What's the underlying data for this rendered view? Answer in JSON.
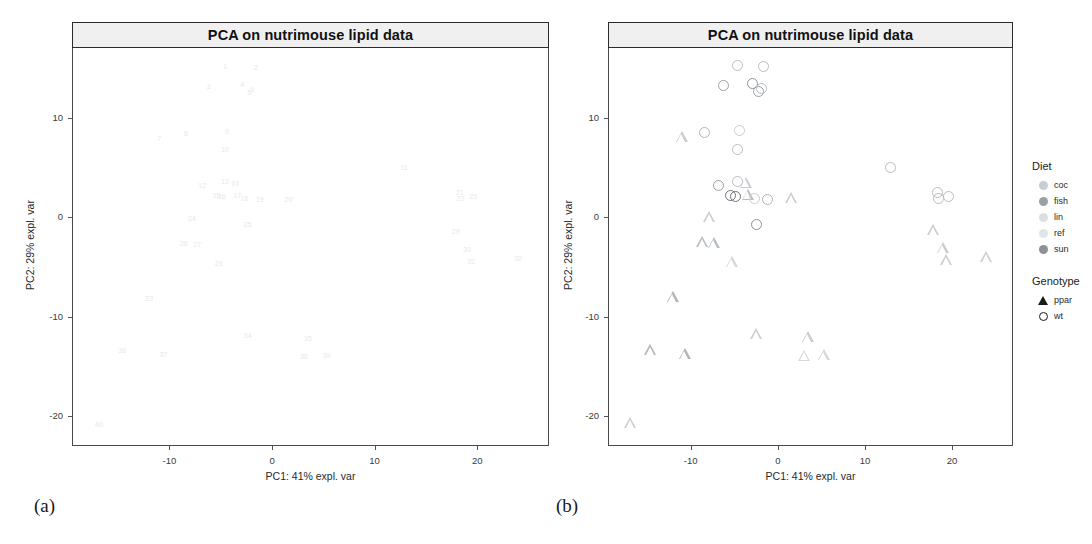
{
  "figure": {
    "panels": [
      {
        "id": "a",
        "sublabel": "(a)",
        "has_legend": false,
        "marker_mode": "text-ids"
      },
      {
        "id": "b",
        "sublabel": "(b)",
        "has_legend": true,
        "marker_mode": "shapes"
      }
    ]
  },
  "chart_data": {
    "type": "scatter",
    "title": "PCA on nutrimouse lipid data",
    "xlabel": "PC1: 41% expl. var",
    "ylabel": "PC2: 29% expl. var",
    "xlim": [
      -19.5,
      27.0
    ],
    "ylim": [
      -23.0,
      17.0
    ],
    "xticks": [
      -10,
      0,
      10,
      20
    ],
    "yticks": [
      10,
      0,
      -10,
      -20
    ],
    "xtick_labels": [
      "-10",
      "0",
      "10",
      "20"
    ],
    "ytick_labels": [
      "10",
      "0",
      "-10",
      "-20"
    ],
    "grid": false,
    "legend_position": "right",
    "legends": [
      {
        "title": "Diet",
        "key_type": "fill-circle",
        "entries": [
          {
            "label": "coc",
            "color": "#c9cdd1"
          },
          {
            "label": "fish",
            "color": "#9aa0a6"
          },
          {
            "label": "lin",
            "color": "#dcdfe2"
          },
          {
            "label": "ref",
            "color": "#e2e5e8"
          },
          {
            "label": "sun",
            "color": "#8b9197"
          }
        ]
      },
      {
        "title": "Genotype",
        "key_type": "shape",
        "entries": [
          {
            "label": "ppar",
            "shape": "triangle"
          },
          {
            "label": "wt",
            "shape": "circle"
          }
        ]
      }
    ],
    "points": [
      {
        "id": "1",
        "x": -4.6,
        "y": 15.2,
        "diet": "ref",
        "genotype": "wt",
        "color": "#b9bec3"
      },
      {
        "id": "2",
        "x": -1.6,
        "y": 15.1,
        "diet": "coc",
        "genotype": "wt",
        "color": "#b9bec3"
      },
      {
        "id": "3",
        "x": -6.2,
        "y": 13.2,
        "diet": "lin",
        "genotype": "wt",
        "color": "#9aa0a6"
      },
      {
        "id": "4",
        "x": -2.9,
        "y": 13.4,
        "diet": "fish",
        "genotype": "wt",
        "color": "#8b9197"
      },
      {
        "id": "5",
        "x": -2.2,
        "y": 12.6,
        "diet": "sun",
        "genotype": "wt",
        "color": "#9aa0a6"
      },
      {
        "id": "6",
        "x": -1.9,
        "y": 12.9,
        "diet": "ref",
        "genotype": "wt",
        "color": "#b9bec3"
      },
      {
        "id": "7",
        "x": -11.0,
        "y": 8.0,
        "diet": "coc",
        "genotype": "ppar",
        "color": "#c9cdd1"
      },
      {
        "id": "8",
        "x": -8.4,
        "y": 8.5,
        "diet": "lin",
        "genotype": "wt",
        "color": "#b0b5ba"
      },
      {
        "id": "9",
        "x": -4.4,
        "y": 8.7,
        "diet": "ref",
        "genotype": "wt",
        "color": "#c9cdd1"
      },
      {
        "id": "10",
        "x": -4.6,
        "y": 6.8,
        "diet": "sun",
        "genotype": "wt",
        "color": "#b9bec3"
      },
      {
        "id": "11",
        "x": 12.9,
        "y": 5.0,
        "diet": "fish",
        "genotype": "wt",
        "color": "#b9bec3"
      },
      {
        "id": "12",
        "x": -6.8,
        "y": 3.2,
        "diet": "coc",
        "genotype": "wt",
        "color": "#9aa0a6"
      },
      {
        "id": "13",
        "x": -4.6,
        "y": 3.6,
        "diet": "lin",
        "genotype": "wt",
        "color": "#b9bec3"
      },
      {
        "id": "14",
        "x": -3.6,
        "y": 3.4,
        "diet": "ref",
        "genotype": "ppar",
        "color": "#c9cdd1"
      },
      {
        "id": "15",
        "x": -5.4,
        "y": 2.2,
        "diet": "sun",
        "genotype": "wt",
        "color": "#6f7479"
      },
      {
        "id": "16",
        "x": -4.9,
        "y": 2.1,
        "diet": "fish",
        "genotype": "wt",
        "color": "#6f7479"
      },
      {
        "id": "17",
        "x": -3.4,
        "y": 2.2,
        "diet": "coc",
        "genotype": "ppar",
        "color": "#b9bec3"
      },
      {
        "id": "18",
        "x": -2.7,
        "y": 1.9,
        "diet": "lin",
        "genotype": "wt",
        "color": "#c9cdd1"
      },
      {
        "id": "19",
        "x": -1.2,
        "y": 1.8,
        "diet": "ref",
        "genotype": "wt",
        "color": "#b0b5ba"
      },
      {
        "id": "20",
        "x": 1.6,
        "y": 1.8,
        "diet": "sun",
        "genotype": "ppar",
        "color": "#c9cdd1"
      },
      {
        "id": "21",
        "x": 18.3,
        "y": 2.5,
        "diet": "fish",
        "genotype": "wt",
        "color": "#b9bec3"
      },
      {
        "id": "22",
        "x": 18.4,
        "y": 1.9,
        "diet": "coc",
        "genotype": "wt",
        "color": "#b9bec3"
      },
      {
        "id": "23",
        "x": 19.6,
        "y": 2.1,
        "diet": "lin",
        "genotype": "wt",
        "color": "#b9bec3"
      },
      {
        "id": "24",
        "x": -7.8,
        "y": -0.1,
        "diet": "ref",
        "genotype": "ppar",
        "color": "#c9cdd1"
      },
      {
        "id": "25",
        "x": -2.4,
        "y": -0.7,
        "diet": "sun",
        "genotype": "wt",
        "color": "#8b9197"
      },
      {
        "id": "26",
        "x": -8.6,
        "y": -2.6,
        "diet": "fish",
        "genotype": "ppar",
        "color": "#b9bec3"
      },
      {
        "id": "27",
        "x": -7.3,
        "y": -2.7,
        "diet": "coc",
        "genotype": "ppar",
        "color": "#b9bec3"
      },
      {
        "id": "28",
        "x": 17.9,
        "y": -1.4,
        "diet": "lin",
        "genotype": "ppar",
        "color": "#c9cdd1"
      },
      {
        "id": "29",
        "x": -5.2,
        "y": -4.6,
        "diet": "ref",
        "genotype": "ppar",
        "color": "#d4d8db"
      },
      {
        "id": "30",
        "x": 19.0,
        "y": -3.2,
        "diet": "sun",
        "genotype": "ppar",
        "color": "#c9cdd1"
      },
      {
        "id": "31",
        "x": 19.4,
        "y": -4.4,
        "diet": "fish",
        "genotype": "ppar",
        "color": "#c9cdd1"
      },
      {
        "id": "32",
        "x": 24.0,
        "y": -4.1,
        "diet": "coc",
        "genotype": "ppar",
        "color": "#c9cdd1"
      },
      {
        "id": "33",
        "x": -12.0,
        "y": -8.1,
        "diet": "lin",
        "genotype": "ppar",
        "color": "#b0b5ba"
      },
      {
        "id": "34",
        "x": -2.4,
        "y": -11.8,
        "diet": "ref",
        "genotype": "ppar",
        "color": "#c9cdd1"
      },
      {
        "id": "35",
        "x": 3.5,
        "y": -12.1,
        "diet": "sun",
        "genotype": "ppar",
        "color": "#c9cdd1"
      },
      {
        "id": "36",
        "x": -14.6,
        "y": -13.4,
        "diet": "fish",
        "genotype": "ppar",
        "color": "#b0b5ba"
      },
      {
        "id": "37",
        "x": -10.6,
        "y": -13.8,
        "diet": "coc",
        "genotype": "ppar",
        "color": "#b0b5ba"
      },
      {
        "id": "38",
        "x": 3.1,
        "y": -14.0,
        "diet": "lin",
        "genotype": "ppar",
        "color": "#d4d8db"
      },
      {
        "id": "39",
        "x": 5.3,
        "y": -13.9,
        "diet": "ref",
        "genotype": "ppar",
        "color": "#d4d8db"
      },
      {
        "id": "40",
        "x": -16.9,
        "y": -20.8,
        "diet": "sun",
        "genotype": "ppar",
        "color": "#c9cdd1"
      }
    ]
  }
}
